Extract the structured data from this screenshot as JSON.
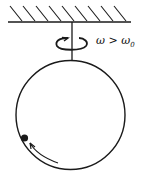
{
  "diagram": {
    "label_omega": "ω > ω",
    "label_sub": "0",
    "colors": {
      "stroke": "#1a1a1a",
      "background": "#ffffff"
    },
    "elements": [
      "ceiling-hatch",
      "vertical-rod",
      "rotation-arrow",
      "circular-hoop",
      "bead",
      "motion-arrow"
    ]
  }
}
